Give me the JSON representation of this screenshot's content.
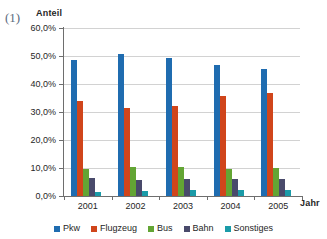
{
  "figure_number": "(1)",
  "top_cut_text": "",
  "axis_titles": {
    "y": "Anteil",
    "x": "Jahr"
  },
  "legend": {
    "position": "bottom",
    "entries": [
      {
        "label": "Pkw",
        "color": "#1f6cb0"
      },
      {
        "label": "Flugzeug",
        "color": "#d0451b"
      },
      {
        "label": "Bus",
        "color": "#63a534"
      },
      {
        "label": "Bahn",
        "color": "#494a6b"
      },
      {
        "label": "Sonstiges",
        "color": "#1a9ba8"
      }
    ]
  },
  "chart_data": {
    "type": "bar",
    "title": "",
    "subtitle": "",
    "xlabel": "Jahr",
    "ylabel": "Anteil",
    "categories": [
      "2001",
      "2002",
      "2003",
      "2004",
      "2005"
    ],
    "ylim": [
      0,
      60
    ],
    "ytick_labels": [
      "60,0%",
      "50,0%",
      "40,0%",
      "30,0%",
      "20,0%",
      "10,0%",
      "0,0%"
    ],
    "ytick_values": [
      60,
      50,
      40,
      30,
      20,
      10,
      0
    ],
    "grid": true,
    "unit": "%",
    "decimal_separator": ",",
    "legend_position": "bottom",
    "series": [
      {
        "name": "Pkw",
        "color": "#1f6cb0",
        "values": [
          48.4,
          50.6,
          49.3,
          46.7,
          45.2
        ]
      },
      {
        "name": "Flugzeug",
        "color": "#d0451b",
        "values": [
          33.8,
          31.5,
          32.3,
          35.8,
          36.9
        ]
      },
      {
        "name": "Bus",
        "color": "#63a534",
        "values": [
          9.8,
          10.2,
          10.2,
          9.5,
          10.1
        ]
      },
      {
        "name": "Bahn",
        "color": "#494a6b",
        "values": [
          6.6,
          5.8,
          6.0,
          5.9,
          6.1
        ]
      },
      {
        "name": "Sonstiges",
        "color": "#1a9ba8",
        "values": [
          1.3,
          1.7,
          2.2,
          2.3,
          2.1
        ]
      }
    ]
  }
}
